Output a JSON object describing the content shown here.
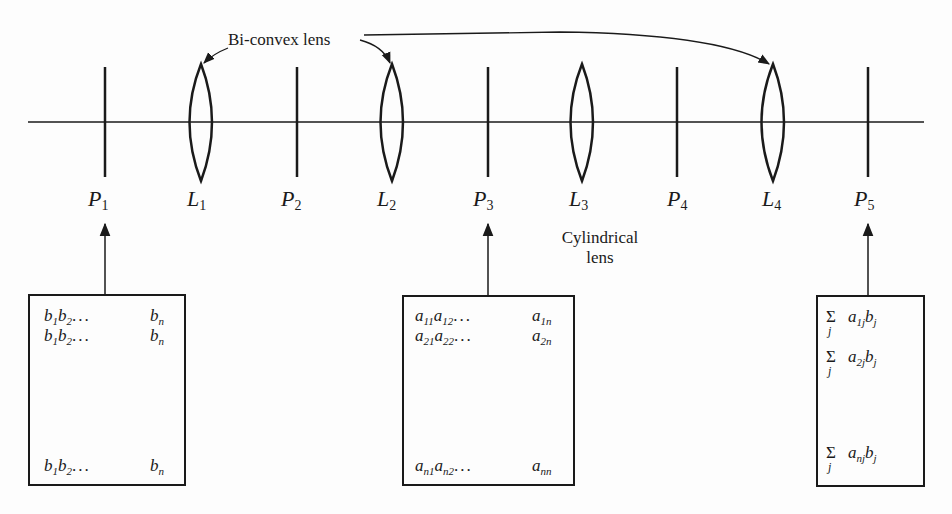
{
  "diagram": {
    "title_label": "Bi-convex lens",
    "cylindrical_label_line1": "Cylindrical",
    "cylindrical_label_line2": "lens",
    "optical_elements": [
      {
        "id": "P1",
        "letter": "P",
        "sub": "1",
        "type": "plane"
      },
      {
        "id": "L1",
        "letter": "L",
        "sub": "1",
        "type": "bi-convex lens"
      },
      {
        "id": "P2",
        "letter": "P",
        "sub": "2",
        "type": "plane"
      },
      {
        "id": "L2",
        "letter": "L",
        "sub": "2",
        "type": "bi-convex lens"
      },
      {
        "id": "P3",
        "letter": "P",
        "sub": "3",
        "type": "plane"
      },
      {
        "id": "L3",
        "letter": "L",
        "sub": "3",
        "type": "cylindrical lens"
      },
      {
        "id": "P4",
        "letter": "P",
        "sub": "4",
        "type": "plane"
      },
      {
        "id": "L4",
        "letter": "L",
        "sub": "4",
        "type": "bi-convex lens"
      },
      {
        "id": "P5",
        "letter": "P",
        "sub": "5",
        "type": "plane"
      }
    ],
    "box_vector": {
      "points_to": "P1",
      "rows": [
        {
          "a": "b",
          "a_sub": "1",
          "b": "b",
          "b_sub": "2",
          "dots": "...",
          "last": "b",
          "last_sub": "n"
        },
        {
          "a": "b",
          "a_sub": "1",
          "b": "b",
          "b_sub": "2",
          "dots": "...",
          "last": "b",
          "last_sub": "n"
        },
        {
          "a": "b",
          "a_sub": "1",
          "b": "b",
          "b_sub": "2",
          "dots": "...",
          "last": "b",
          "last_sub": "n"
        }
      ]
    },
    "box_matrix": {
      "points_to": "P3",
      "rows": [
        {
          "a": "a",
          "a_sub": "11",
          "b": "a",
          "b_sub": "12",
          "dots": "...",
          "last": "a",
          "last_sub": "1n"
        },
        {
          "a": "a",
          "a_sub": "21",
          "b": "a",
          "b_sub": "22",
          "dots": "...",
          "last": "a",
          "last_sub": "2n"
        },
        {
          "a": "a",
          "a_sub": "n1",
          "b": "a",
          "b_sub": "n2",
          "dots": "...",
          "last": "a",
          "last_sub": "nn"
        }
      ]
    },
    "box_result": {
      "points_to": "P5",
      "rows": [
        {
          "sigma": "Σ",
          "index": "j",
          "coef": "a",
          "coef_sub": "1j",
          "var": "b",
          "var_sub": "j"
        },
        {
          "sigma": "Σ",
          "index": "j",
          "coef": "a",
          "coef_sub": "2j",
          "var": "b",
          "var_sub": "j"
        },
        {
          "sigma": "Σ",
          "index": "j",
          "coef": "a",
          "coef_sub": "nj",
          "var": "b",
          "var_sub": "j"
        }
      ]
    }
  }
}
